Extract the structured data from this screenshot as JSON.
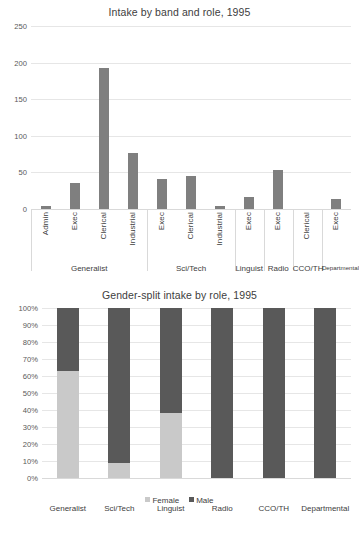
{
  "colors": {
    "bar_gray": "#7f7f7f",
    "female": "#c9c9c9",
    "male": "#595959",
    "gridline": "#e6e6e6",
    "text": "#404040"
  },
  "chart_data": [
    {
      "type": "bar",
      "title": "Intake by band and role, 1995",
      "xlabel": "",
      "ylabel": "",
      "ylim": [
        0,
        250
      ],
      "yticks": [
        "0",
        "50",
        "100",
        "150",
        "200",
        "250"
      ],
      "ytick_values": [
        0,
        50,
        100,
        150,
        200,
        250
      ],
      "grid": true,
      "legend": "none",
      "categories": [
        "Admin",
        "Exec",
        "Clerical",
        "Industrial",
        "Exec",
        "Clerical",
        "Industrial",
        "Exec",
        "Exec",
        "Clerical",
        "Exec"
      ],
      "values": [
        4,
        36,
        193,
        77,
        41,
        45,
        4,
        16,
        53,
        0,
        13
      ],
      "groups": [
        {
          "label": "Generalist",
          "span": 4
        },
        {
          "label": "Sci/Tech",
          "span": 3
        },
        {
          "label": "Linguist",
          "span": 1
        },
        {
          "label": "Radio",
          "span": 1
        },
        {
          "label": "CCO/TH",
          "span": 1
        },
        {
          "label": "Departmental",
          "span": 1
        }
      ]
    },
    {
      "type": "bar",
      "subtype": "stacked-100",
      "title": "Gender-split intake by role, 1995",
      "xlabel": "",
      "ylabel": "",
      "ylim": [
        0,
        100
      ],
      "yticks": [
        "0%",
        "10%",
        "20%",
        "30%",
        "40%",
        "50%",
        "60%",
        "70%",
        "80%",
        "90%",
        "100%"
      ],
      "ytick_values": [
        0,
        10,
        20,
        30,
        40,
        50,
        60,
        70,
        80,
        90,
        100
      ],
      "grid": true,
      "legend": "bottom",
      "categories": [
        "Generalist",
        "Sci/Tech",
        "Linguist",
        "Radio",
        "CCO/TH",
        "Departmental"
      ],
      "series": [
        {
          "name": "Female",
          "color": "#c9c9c9",
          "values": [
            63,
            9,
            38,
            0,
            0,
            0
          ]
        },
        {
          "name": "Male",
          "color": "#595959",
          "values": [
            37,
            91,
            62,
            100,
            100,
            100
          ]
        }
      ]
    }
  ]
}
